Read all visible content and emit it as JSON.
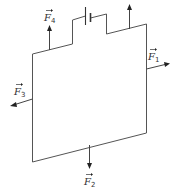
{
  "diagram": {
    "colors": {
      "wire": "#555555",
      "arrow": "#444444",
      "text": "#333333",
      "background": "#ffffff"
    },
    "forces": [
      {
        "id": "F1",
        "symbol": "F",
        "subscript": "1",
        "direction": "right"
      },
      {
        "id": "F2",
        "symbol": "F",
        "subscript": "2",
        "direction": "down"
      },
      {
        "id": "F3",
        "symbol": "F",
        "subscript": "3",
        "direction": "left"
      },
      {
        "id": "F4",
        "symbol": "F",
        "subscript": "4",
        "direction": "up"
      }
    ],
    "unlabeled_arrow": {
      "direction": "up",
      "location": "top-right wire"
    },
    "battery": {
      "location": "top wire, between steps"
    }
  }
}
